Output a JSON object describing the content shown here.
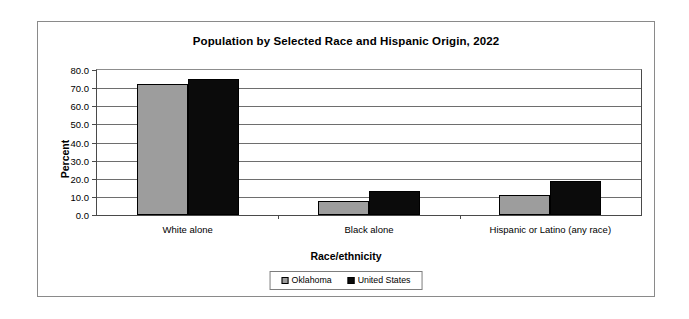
{
  "chart_data": {
    "type": "bar",
    "title": "Population by Selected Race and Hispanic Origin, 2022",
    "xlabel": "Race/ethnicity",
    "ylabel": "Percent",
    "categories": [
      "White alone",
      "Black alone",
      "Hispanic or Latino (any race)"
    ],
    "series": [
      {
        "name": "Oklahoma",
        "color": "#9d9d9d",
        "values": [
          72.5,
          7.5,
          11.0
        ]
      },
      {
        "name": "United States",
        "color": "#0b0b0b",
        "values": [
          75.3,
          13.0,
          19.0
        ]
      }
    ],
    "ylim": [
      0.0,
      80.0
    ],
    "ytick_step": 10.0,
    "ytick_labels": [
      "0.0",
      "10.0",
      "20.0",
      "30.0",
      "40.0",
      "50.0",
      "60.0",
      "70.0",
      "80.0"
    ],
    "ytick_values": [
      0.0,
      10.0,
      20.0,
      30.0,
      40.0,
      50.0,
      60.0,
      70.0,
      80.0
    ],
    "grid": true,
    "legend_position": "bottom"
  },
  "legend": {
    "entries": [
      {
        "label": "Oklahoma"
      },
      {
        "label": "United States"
      }
    ]
  }
}
